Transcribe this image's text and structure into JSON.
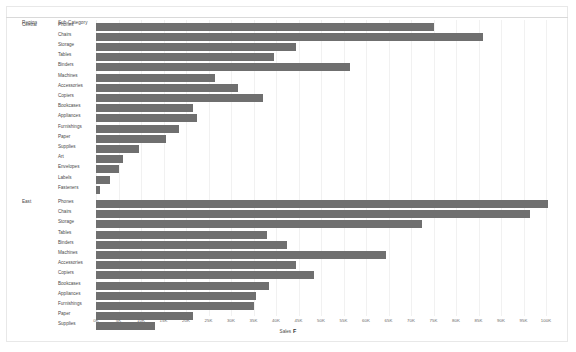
{
  "header": {
    "region_label": "Region",
    "subcategory_label": "Sub-Category"
  },
  "axis": {
    "title": "Sales",
    "field_chip": "F",
    "ticks": [
      "0K",
      "5K",
      "10K",
      "15K",
      "20K",
      "25K",
      "30K",
      "35K",
      "40K",
      "45K",
      "50K",
      "55K",
      "60K",
      "65K",
      "70K",
      "75K",
      "80K",
      "85K",
      "90K",
      "95K",
      "100K"
    ],
    "min": 0,
    "max": 100000
  },
  "style": {
    "bar_color": "#6f6f6f",
    "grid_color": "#f1f1f1",
    "text_color": "#4a4a4a",
    "background": "#ffffff"
  },
  "chart_data": {
    "type": "bar",
    "orientation": "horizontal",
    "title": "",
    "xlabel": "Sales",
    "ylabel": "Sub-Category",
    "xlim": [
      0,
      100000
    ],
    "grid": true,
    "legend": null,
    "group_field": "Region",
    "groups": [
      {
        "name": "Central",
        "categories": [
          "Phones",
          "Chairs",
          "Storage",
          "Tables",
          "Binders",
          "Machines",
          "Accessories",
          "Copiers",
          "Bookcases",
          "Appliances",
          "Furnishings",
          "Paper",
          "Supplies",
          "Art",
          "Envelopes",
          "Labels",
          "Fasteners"
        ],
        "values": [
          75000,
          86000,
          44500,
          39500,
          56500,
          26500,
          31500,
          37000,
          21500,
          22500,
          18500,
          15500,
          9500,
          6000,
          5200,
          3200,
          800
        ]
      },
      {
        "name": "East",
        "categories": [
          "Phones",
          "Chairs",
          "Storage",
          "Tables",
          "Binders",
          "Machines",
          "Accessories",
          "Copiers",
          "Bookcases",
          "Appliances",
          "Furnishings",
          "Paper",
          "Supplies"
        ],
        "values": [
          100500,
          96500,
          72500,
          38000,
          42500,
          64500,
          44500,
          48500,
          38500,
          35500,
          35000,
          21500,
          13000
        ]
      }
    ]
  }
}
